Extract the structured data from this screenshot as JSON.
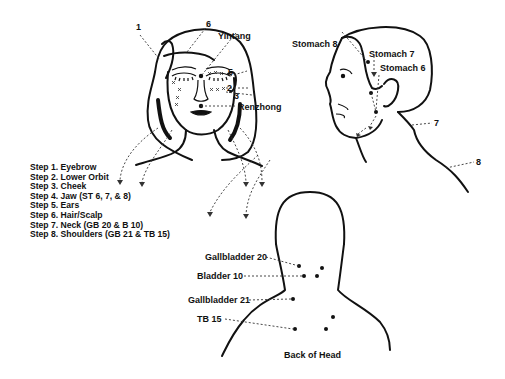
{
  "front_face": {
    "labels": {
      "p1": "1",
      "p6": "6",
      "yintang": "Yintang",
      "p5": "5",
      "p2": "2",
      "p3": "3",
      "renzhong": "Renzhong"
    }
  },
  "steps": [
    "Step 1. Eyebrow",
    "Step 2. Lower Orbit",
    "Step 3. Cheek",
    "Step 4. Jaw (ST 6, 7, & 8)",
    "Step 5. Ears",
    "Step 6. Hair/Scalp",
    "Step 7. Neck (GB 20 & B 10)",
    "Step 8. Shoulders (GB 21 & TB 15)"
  ],
  "side_profile": {
    "labels": {
      "stomach8": "Stomach 8",
      "stomach7": "Stomach 7",
      "stomach6": "Stomach 6",
      "p7": "7",
      "p8": "8"
    }
  },
  "back_view": {
    "labels": {
      "gb20": "Gallbladder 20",
      "b10": "Bladder 10",
      "gb21": "Gallbladder 21",
      "tb15": "TB 15"
    },
    "caption": "Back of Head"
  },
  "colors": {
    "ink": "#111111",
    "background": "#ffffff"
  }
}
